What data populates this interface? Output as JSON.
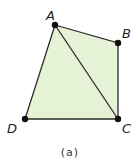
{
  "figure": {
    "caption": "(a)",
    "fill_color": "#e6f2d6",
    "stroke_color": "#2a2a2a",
    "points": [
      {
        "label": "A",
        "x": 55,
        "y": 25
      },
      {
        "label": "B",
        "x": 118,
        "y": 43
      },
      {
        "label": "C",
        "x": 118,
        "y": 119
      },
      {
        "label": "D",
        "x": 25,
        "y": 119
      }
    ],
    "segments": [
      "AB",
      "BC",
      "CD",
      "DA",
      "AC"
    ]
  }
}
